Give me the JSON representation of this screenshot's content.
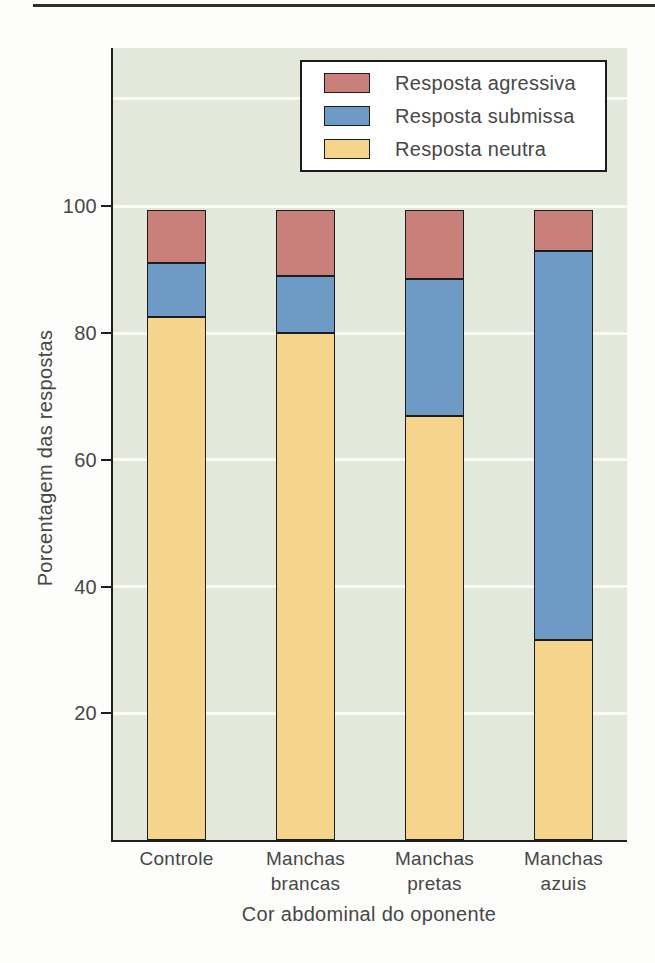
{
  "figure": {
    "ylabel": "Porcentagem das respostas",
    "xlabel": "Cor abdominal do oponente"
  },
  "legend": {
    "items": [
      {
        "label": "Resposta agressiva",
        "color": "#c9807a"
      },
      {
        "label": "Resposta submissa",
        "color": "#6e9bc6"
      },
      {
        "label": "Resposta neutra",
        "color": "#f5d48c"
      }
    ]
  },
  "chart_data": {
    "type": "bar",
    "stacked": true,
    "title": "",
    "xlabel": "Cor abdominal do oponente",
    "ylabel": "Porcentagem das respostas",
    "categories": [
      "Controle",
      "Manchas brancas",
      "Manchas pretas",
      "Manchas azuis"
    ],
    "category_lines": [
      [
        "Controle"
      ],
      [
        "Manchas",
        "brancas"
      ],
      [
        "Manchas",
        "pretas"
      ],
      [
        "Manchas",
        "azuis"
      ]
    ],
    "series": [
      {
        "name": "Resposta neutra",
        "color": "#f5d48c",
        "values": [
          82.5,
          80.0,
          67.0,
          31.5
        ]
      },
      {
        "name": "Resposta submissa",
        "color": "#6e9bc6",
        "values": [
          8.5,
          9.0,
          21.5,
          61.5
        ]
      },
      {
        "name": "Resposta agressiva",
        "color": "#c9807a",
        "values": [
          8.5,
          10.5,
          11.0,
          6.5
        ]
      }
    ],
    "totals": [
      99.5,
      99.5,
      99.5,
      99.5
    ],
    "yticks": [
      20,
      40,
      60,
      80,
      100
    ],
    "ylim": [
      0,
      125
    ],
    "grid": true,
    "gridline_values": [
      20,
      40,
      60,
      80,
      100,
      117
    ],
    "legend_position": "top-right",
    "colors": {
      "plot_bg": "#e3e8da",
      "gridline": "#fafbf4",
      "axis": "#1f1f1f",
      "text": "#474747",
      "top_rule": "#2f2f2f"
    }
  }
}
